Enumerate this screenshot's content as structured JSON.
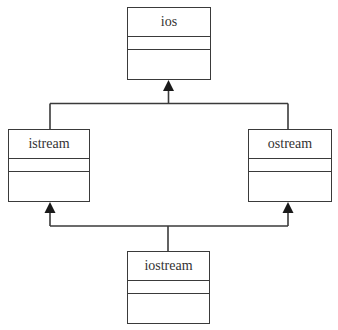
{
  "diagram": {
    "type": "uml-class-inheritance",
    "classes": [
      {
        "id": "ios",
        "name": "ios",
        "attributes": [],
        "methods": []
      },
      {
        "id": "istream",
        "name": "istream",
        "attributes": [],
        "methods": [],
        "inherits": "ios"
      },
      {
        "id": "ostream",
        "name": "ostream",
        "attributes": [],
        "methods": [],
        "inherits": "ios"
      },
      {
        "id": "iostream",
        "name": "iostream",
        "attributes": [],
        "methods": [],
        "inherits": [
          "istream",
          "ostream"
        ]
      }
    ],
    "relationships": [
      {
        "from": "istream",
        "to": "ios",
        "kind": "generalization"
      },
      {
        "from": "ostream",
        "to": "ios",
        "kind": "generalization"
      },
      {
        "from": "iostream",
        "to": "istream",
        "kind": "generalization"
      },
      {
        "from": "iostream",
        "to": "ostream",
        "kind": "generalization"
      }
    ],
    "colors": {
      "line": "#3a3a3a",
      "text": "#333333",
      "background": "#ffffff"
    }
  }
}
